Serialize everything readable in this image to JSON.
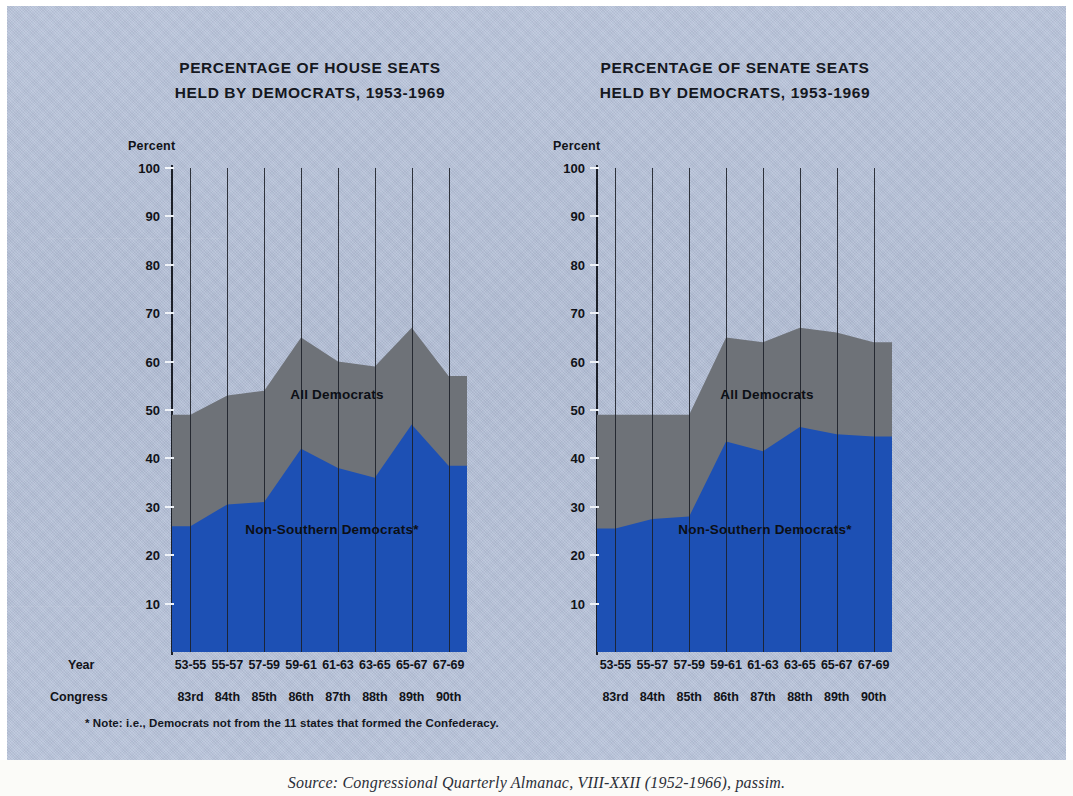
{
  "figure": {
    "y_axis_title": "Percent",
    "row_label_year": "Year",
    "row_label_congress": "Congress",
    "footnote": "* Note: i.e., Democrats not from the 11 states that formed the Confederacy.",
    "source": "Source: Congressional Quarterly Almanac, VIII-XXII (1952-1966), passim.",
    "colors": {
      "background": "#b6c2da",
      "all_democrats": "#6e7278",
      "non_southern_democrats": "#1d50b4",
      "axis": "#1c2029",
      "text": "#111318"
    }
  },
  "chart_data": [
    {
      "type": "area",
      "id": "house",
      "title": "PERCENTAGE OF HOUSE SEATS",
      "subtitle": "HELD BY DEMOCRATS, 1953-1969",
      "xlabel": "",
      "ylabel": "Percent",
      "ylim": [
        0,
        100
      ],
      "yticks": [
        10,
        20,
        30,
        40,
        50,
        60,
        70,
        80,
        90,
        100
      ],
      "grid": "vertical",
      "legend": "inline-labels",
      "stacked": false,
      "categories": [
        "53-55",
        "55-57",
        "57-59",
        "59-61",
        "61-63",
        "63-65",
        "65-67",
        "67-69"
      ],
      "congress": [
        "83rd",
        "84th",
        "85th",
        "86th",
        "87th",
        "88th",
        "89th",
        "90th"
      ],
      "series": [
        {
          "name": "All Democrats",
          "color": "#6e7278",
          "values": [
            49,
            53,
            54,
            65,
            60,
            59,
            67,
            57
          ]
        },
        {
          "name": "Non-Southern Democrats*",
          "color": "#1d50b4",
          "values": [
            26,
            30.5,
            31,
            42,
            38,
            36,
            47,
            38.5
          ]
        }
      ],
      "annotations": [
        {
          "text": "All Democrats",
          "series": "All Democrats"
        },
        {
          "text": "Non-Southern Democrats*",
          "series": "Non-Southern Democrats*"
        }
      ]
    },
    {
      "type": "area",
      "id": "senate",
      "title": "PERCENTAGE OF SENATE SEATS",
      "subtitle": "HELD BY DEMOCRATS, 1953-1969",
      "xlabel": "",
      "ylabel": "Percent",
      "ylim": [
        0,
        100
      ],
      "yticks": [
        10,
        20,
        30,
        40,
        50,
        60,
        70,
        80,
        90,
        100
      ],
      "grid": "vertical",
      "legend": "inline-labels",
      "stacked": false,
      "categories": [
        "53-55",
        "55-57",
        "57-59",
        "59-61",
        "61-63",
        "63-65",
        "65-67",
        "67-69"
      ],
      "congress": [
        "83rd",
        "84th",
        "85th",
        "86th",
        "87th",
        "88th",
        "89th",
        "90th"
      ],
      "series": [
        {
          "name": "All Democrats",
          "color": "#6e7278",
          "values": [
            49,
            49,
            49,
            65,
            64,
            67,
            66,
            64
          ]
        },
        {
          "name": "Non-Southern Democrats*",
          "color": "#1d50b4",
          "values": [
            25.5,
            27.5,
            28,
            43.5,
            41.5,
            46.5,
            45,
            44.5
          ]
        }
      ],
      "annotations": [
        {
          "text": "All Democrats",
          "series": "All Democrats"
        },
        {
          "text": "Non-Southern Democrats*",
          "series": "Non-Southern Democrats*"
        }
      ]
    }
  ]
}
